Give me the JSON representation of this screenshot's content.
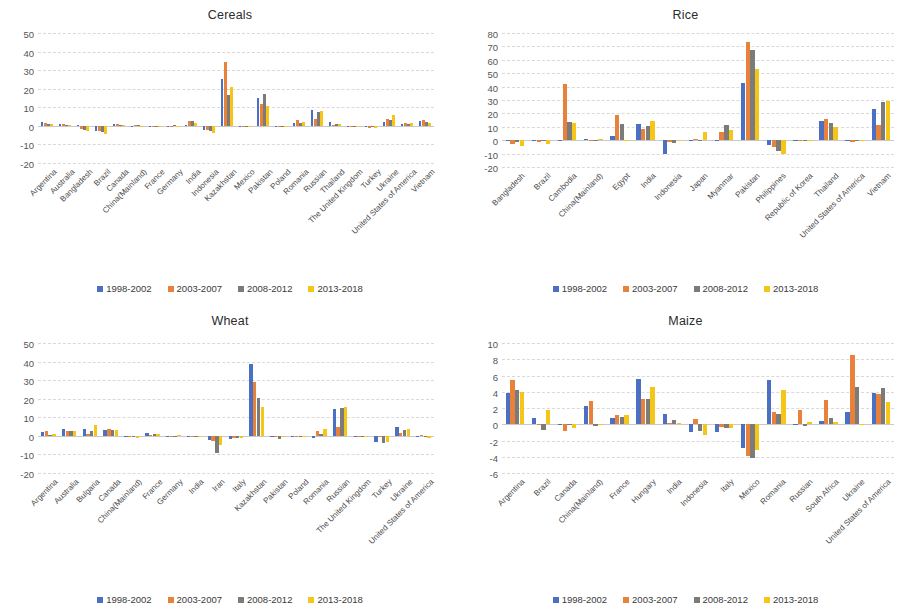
{
  "colors": {
    "series": [
      "#4A6FC3",
      "#E8813A",
      "#7B7B7B",
      "#F5C518"
    ],
    "gridline": "#d9d9d9",
    "axis_text": "#555555",
    "title_text": "#2b2b2b"
  },
  "legend": {
    "items": [
      "1998-2002",
      "2003-2007",
      "2008-2012",
      "2013-2018"
    ]
  },
  "series_names": [
    "1998-2002",
    "2003-2007",
    "2008-2012",
    "2013-2018"
  ],
  "panels": [
    {
      "title": "Cereals"
    },
    {
      "title": "Rice"
    },
    {
      "title": "Wheat"
    },
    {
      "title": "Maize"
    }
  ],
  "chart_data": [
    {
      "type": "bar",
      "title": "Cereals",
      "xlabel": "",
      "ylabel": "",
      "ylim": [
        -20,
        50
      ],
      "yticks": [
        50,
        40,
        30,
        20,
        10,
        0,
        -10,
        -20
      ],
      "grid": true,
      "legend_position": "bottom",
      "categories": [
        "Argentina",
        "Australia",
        "Bangladesh",
        "Brazil",
        "Canada",
        "China(Mainland)",
        "France",
        "Germany",
        "India",
        "Indonesia",
        "Kazakhstan",
        "Mexico",
        "Pakistan",
        "Poland",
        "Romania",
        "Russian",
        "Thailand",
        "The United Kingdom",
        "Turkey",
        "Ukraine",
        "United States of America",
        "Vietnam"
      ],
      "series": [
        {
          "name": "1998-2002",
          "values": [
            2.2,
            1.2,
            0.3,
            -3.0,
            1.0,
            0.1,
            -0.2,
            0.1,
            0.2,
            -2.4,
            25.0,
            -0.8,
            14.8,
            -0.1,
            1.3,
            8.4,
            2.0,
            -0.1,
            -0.5,
            2.2,
            1.0,
            2.6
          ]
        },
        {
          "name": "2003-2007",
          "values": [
            1.6,
            1.0,
            -1.9,
            -2.6,
            0.8,
            0.2,
            -0.3,
            0.0,
            2.8,
            -2.0,
            34.5,
            -0.6,
            12.0,
            -0.2,
            3.2,
            3.5,
            0.6,
            -0.2,
            -1.2,
            3.8,
            1.4,
            3.2
          ]
        },
        {
          "name": "2008-2012",
          "values": [
            1.2,
            0.5,
            -2.3,
            -3.1,
            0.5,
            0.2,
            0.1,
            0.2,
            2.4,
            -2.6,
            16.5,
            -0.5,
            17.1,
            -0.1,
            1.6,
            7.6,
            1.1,
            -0.1,
            -0.6,
            2.9,
            1.1,
            2.2
          ]
        },
        {
          "name": "2013-2018",
          "values": [
            1.0,
            0.4,
            -3.0,
            -4.3,
            0.4,
            0.1,
            0.1,
            0.1,
            1.8,
            -3.6,
            21.0,
            -0.4,
            10.8,
            -0.2,
            2.3,
            7.8,
            0.8,
            -0.2,
            -1.4,
            6.0,
            1.6,
            1.4
          ]
        }
      ]
    },
    {
      "type": "bar",
      "title": "Rice",
      "xlabel": "",
      "ylabel": "",
      "ylim": [
        -20,
        80
      ],
      "yticks": [
        80,
        70,
        60,
        50,
        40,
        30,
        20,
        10,
        0,
        -10,
        -20
      ],
      "grid": true,
      "legend_position": "bottom",
      "categories": [
        "Bangladesh",
        "Brazil",
        "Cambodia",
        "China(Mainland)",
        "Egypt",
        "India",
        "Indonesia",
        "Japan",
        "Myanmar",
        "Pakistan",
        "Philippines",
        "Republic of Korea",
        "Thailand",
        "United States of America",
        "Vietnam"
      ],
      "series": [
        {
          "name": "1998-2002",
          "values": [
            -0.4,
            -0.6,
            0.5,
            0.6,
            2.8,
            12.4,
            -10.5,
            -0.3,
            0.5,
            43.0,
            -3.8,
            -0.2,
            14.5,
            -0.6,
            23.0
          ]
        },
        {
          "name": "2003-2007",
          "values": [
            -3.2,
            -1.5,
            42.0,
            0.3,
            19.0,
            8.2,
            -1.6,
            0.8,
            6.0,
            73.5,
            -5.2,
            -0.3,
            15.8,
            -1.0,
            11.0
          ]
        },
        {
          "name": "2008-2012",
          "values": [
            -1.0,
            -0.8,
            13.5,
            0.5,
            12.0,
            10.5,
            -1.9,
            -0.2,
            11.5,
            67.0,
            -7.8,
            -0.4,
            12.6,
            -0.3,
            28.5
          ]
        },
        {
          "name": "2013-2018",
          "values": [
            -4.6,
            -3.0,
            13.0,
            1.0,
            0.5,
            14.5,
            -0.6,
            6.2,
            7.6,
            53.0,
            -10.5,
            -0.5,
            9.8,
            -0.4,
            29.0
          ]
        }
      ]
    },
    {
      "type": "bar",
      "title": "Wheat",
      "xlabel": "",
      "ylabel": "",
      "ylim": [
        -20,
        50
      ],
      "yticks": [
        50,
        40,
        30,
        20,
        10,
        0,
        -10,
        -20
      ],
      "grid": true,
      "legend_position": "bottom",
      "categories": [
        "Argentina",
        "Australia",
        "Bulgaria",
        "Canada",
        "China(Mainland)",
        "France",
        "Germany",
        "India",
        "Iran",
        "Italy",
        "Kazakhstan",
        "Pakistan",
        "Poland",
        "Romania",
        "Russian",
        "The United Kingdom",
        "Turkey",
        "Ukraine",
        "United States of America"
      ],
      "series": [
        {
          "name": "1998-2002",
          "values": [
            2.3,
            3.6,
            3.8,
            3.4,
            -0.3,
            1.4,
            0.1,
            -0.4,
            -2.0,
            -1.6,
            38.5,
            0.0,
            -0.3,
            -1.0,
            14.6,
            0.0,
            -3.4,
            4.6,
            -0.3
          ]
        },
        {
          "name": "2003-2007",
          "values": [
            2.7,
            2.8,
            1.2,
            3.8,
            -0.4,
            0.4,
            0.0,
            -0.5,
            -2.6,
            -1.2,
            29.0,
            -0.2,
            -0.2,
            2.4,
            5.0,
            -0.1,
            -0.6,
            1.6,
            0.4
          ]
        },
        {
          "name": "2008-2012",
          "values": [
            0.5,
            2.4,
            2.4,
            3.4,
            -0.5,
            0.8,
            0.1,
            -0.4,
            -9.4,
            -1.0,
            20.5,
            -1.8,
            -0.5,
            1.2,
            15.2,
            -0.1,
            -3.6,
            3.4,
            -0.5
          ]
        },
        {
          "name": "2013-2018",
          "values": [
            1.0,
            2.8,
            5.8,
            3.4,
            -1.0,
            1.0,
            0.2,
            -0.6,
            -4.8,
            -1.4,
            15.5,
            -0.3,
            -0.2,
            3.8,
            15.6,
            -0.2,
            -3.2,
            3.8,
            -1.0
          ]
        }
      ]
    },
    {
      "type": "bar",
      "title": "Maize",
      "xlabel": "",
      "ylabel": "",
      "ylim": [
        -6,
        10
      ],
      "yticks": [
        10,
        8,
        6,
        4,
        2,
        0,
        -2,
        -4,
        -6
      ],
      "grid": true,
      "legend_position": "bottom",
      "categories": [
        "Argentina",
        "Brazil",
        "Canada",
        "China(Mainland)",
        "France",
        "Hungary",
        "India",
        "Indonesia",
        "Italy",
        "Mexico",
        "Romania",
        "Russian",
        "South Africa",
        "Ukraine",
        "United States of America"
      ],
      "series": [
        {
          "name": "1998-2002",
          "values": [
            3.9,
            0.8,
            -0.1,
            2.3,
            0.8,
            5.6,
            1.3,
            -1.0,
            -0.9,
            -2.9,
            5.4,
            -0.1,
            0.4,
            1.5,
            3.8
          ]
        },
        {
          "name": "2003-2007",
          "values": [
            5.4,
            -0.1,
            -0.8,
            2.9,
            1.1,
            3.1,
            0.1,
            0.6,
            -0.3,
            -3.9,
            1.5,
            1.8,
            3.0,
            8.5,
            3.7
          ]
        },
        {
          "name": "2008-2012",
          "values": [
            4.2,
            -0.7,
            -0.1,
            -0.2,
            0.9,
            3.1,
            0.5,
            -0.8,
            -0.4,
            -4.1,
            1.3,
            -0.2,
            0.8,
            4.6,
            4.5
          ]
        },
        {
          "name": "2013-2018",
          "values": [
            4.0,
            1.8,
            -0.5,
            -0.1,
            1.2,
            4.6,
            0.1,
            -1.3,
            -0.4,
            -3.2,
            4.2,
            0.3,
            0.3,
            -0.1,
            2.7
          ]
        }
      ]
    }
  ]
}
